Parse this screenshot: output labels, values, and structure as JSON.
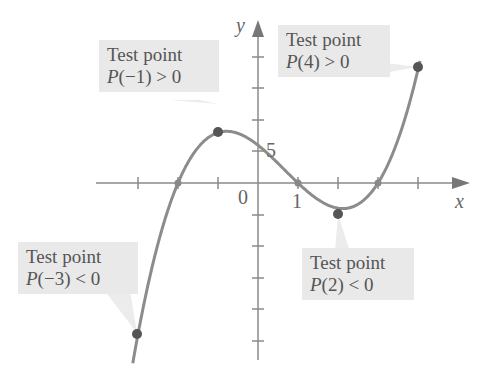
{
  "chart_data": {
    "type": "line",
    "title": "",
    "function": "P(x) = (x+2)(x-1)(x-3)",
    "xlabel": "x",
    "ylabel": "y",
    "x_tick_labels": {
      "0": "0",
      "1": "1"
    },
    "y_tick_labels": {
      "5": "5"
    },
    "x_ticks": [
      -3,
      -2,
      -1,
      0,
      1,
      2,
      3,
      4
    ],
    "y_tick_step": 5,
    "xlim": [
      -3.3,
      5.3
    ],
    "ylim": [
      -27,
      27
    ],
    "zeros": [
      -2,
      1,
      3
    ],
    "test_points": [
      {
        "x": -3,
        "y": -24,
        "label": "Test point",
        "relation": "P(−3) < 0"
      },
      {
        "x": -1,
        "y": 8,
        "label": "Test point",
        "relation": "P(−1) > 0"
      },
      {
        "x": 2,
        "y": -4,
        "label": "Test point",
        "relation": "P(2) < 0"
      },
      {
        "x": 4,
        "y": 18,
        "label": "Test point",
        "relation": "P(4) > 0"
      }
    ],
    "grid": false
  },
  "labels": {
    "x_axis": "x",
    "y_axis": "y",
    "origin": "0",
    "x_one": "1",
    "y_five": "5"
  },
  "callouts": [
    {
      "title": "Test point",
      "fn": "P",
      "arg": "(−1)",
      "rel": " > 0"
    },
    {
      "title": "Test point",
      "fn": "P",
      "arg": "(4)",
      "rel": " > 0"
    },
    {
      "title": "Test point",
      "fn": "P",
      "arg": "(−3)",
      "rel": " < 0"
    },
    {
      "title": "Test point",
      "fn": "P",
      "arg": "(2)",
      "rel": " < 0"
    }
  ],
  "colors": {
    "curve": "#8c8c8c",
    "axis": "#8a8a8a",
    "point": "#555555",
    "callout_bg": "#e9e9e9"
  }
}
